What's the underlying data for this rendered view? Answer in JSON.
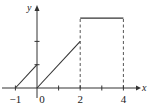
{
  "chart_data": {
    "type": "line",
    "title": "",
    "xlabel": "x",
    "ylabel": "y",
    "xlim": [
      -1,
      4
    ],
    "ylim": [
      0,
      3
    ],
    "x_ticks": [
      -1,
      0,
      1,
      2,
      3,
      4
    ],
    "x_tick_labels": [
      {
        "value": -1,
        "label": "−1"
      },
      {
        "value": 0,
        "label": "0"
      },
      {
        "value": 2,
        "label": "2"
      },
      {
        "value": 4,
        "label": "4"
      }
    ],
    "y_ticks": [
      1,
      2
    ],
    "grid": false,
    "series": [
      {
        "name": "segment-1",
        "style": "solid",
        "points": [
          [
            -1,
            0
          ],
          [
            0,
            1
          ]
        ]
      },
      {
        "name": "segment-2",
        "style": "solid",
        "points": [
          [
            0,
            0
          ],
          [
            2,
            2
          ]
        ]
      },
      {
        "name": "segment-3",
        "style": "solid",
        "points": [
          [
            2,
            3
          ],
          [
            4,
            3
          ]
        ]
      }
    ],
    "guides": [
      {
        "name": "dashed-x2",
        "style": "dashed",
        "points": [
          [
            2,
            0
          ],
          [
            2,
            3
          ]
        ]
      },
      {
        "name": "dashed-x4",
        "style": "dashed",
        "points": [
          [
            4,
            0
          ],
          [
            4,
            3
          ]
        ]
      }
    ],
    "colors": {
      "line": "#333333",
      "axis": "#333333",
      "dashed": "#555555"
    }
  }
}
